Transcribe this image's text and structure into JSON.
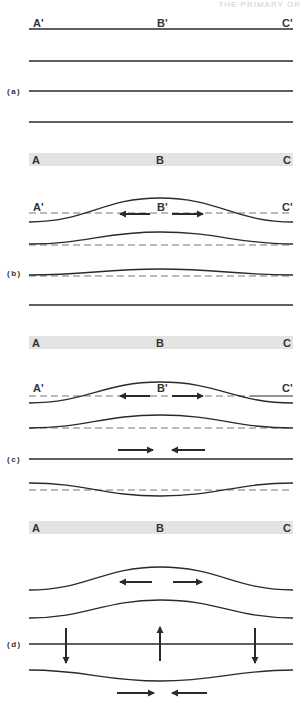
{
  "header": {
    "text": "THE PRIMARY OR"
  },
  "colors": {
    "stroke": "#2a2a2a",
    "dashed": "#777777",
    "band": "#e3e3e3",
    "label": "#333333"
  },
  "x_left": 29,
  "x_mid": 160,
  "x_right": 293,
  "panels": [
    {
      "id": "a",
      "label": "(a)",
      "label_y": 94,
      "top_labels": {
        "y": 27,
        "left": "A'",
        "mid": "B'",
        "right": "C'"
      },
      "curves": [
        {
          "kind": "flat",
          "y": 29
        },
        {
          "kind": "flat",
          "y": 61
        },
        {
          "kind": "flat",
          "y": 91
        },
        {
          "kind": "flat",
          "y": 122
        }
      ],
      "dashed": [],
      "h_arrows": [],
      "v_arrows": [],
      "band": {
        "y": 153,
        "h": 13,
        "left": "A",
        "mid": "B",
        "right": "C"
      }
    },
    {
      "id": "b",
      "label": "(b)",
      "label_y": 276,
      "top_labels": {
        "y": 211,
        "left": "A'",
        "mid": "B'",
        "right": "C'"
      },
      "curves": [
        {
          "kind": "bump",
          "end_y": 222,
          "peak_y": 198
        },
        {
          "kind": "bump",
          "end_y": 244,
          "peak_y": 232
        },
        {
          "kind": "bump",
          "end_y": 275,
          "peak_y": 269
        },
        {
          "kind": "flat",
          "y": 305
        }
      ],
      "dashed": [
        {
          "y": 213
        },
        {
          "y": 245
        },
        {
          "y": 276
        }
      ],
      "h_arrows": [
        {
          "y": 214,
          "from": 150,
          "to": 120
        },
        {
          "y": 214,
          "from": 172,
          "to": 203
        }
      ],
      "v_arrows": [],
      "band": {
        "y": 336,
        "h": 13,
        "left": "A",
        "mid": "B",
        "right": "C"
      }
    },
    {
      "id": "c",
      "label": "(c)",
      "label_y": 462,
      "top_labels": {
        "y": 392,
        "left": "A'",
        "mid": "B'",
        "right": "C'"
      },
      "curves": [
        {
          "kind": "bump",
          "end_y": 403,
          "peak_y": 382
        },
        {
          "kind": "bump",
          "end_y": 428,
          "peak_y": 415
        },
        {
          "kind": "flat",
          "y": 459
        },
        {
          "kind": "bump",
          "end_y": 483,
          "peak_y": 496
        }
      ],
      "dashed": [
        {
          "y": 396,
          "solid_from": 250
        },
        {
          "y": 428
        },
        {
          "y": 490
        }
      ],
      "h_arrows": [
        {
          "y": 214,
          "from": 0,
          "to": 0,
          "skip": true
        },
        {
          "y": 396,
          "from": 150,
          "to": 120
        },
        {
          "y": 396,
          "from": 172,
          "to": 203
        },
        {
          "y": 450,
          "from": 118,
          "to": 153
        },
        {
          "y": 450,
          "from": 205,
          "to": 172
        }
      ],
      "v_arrows": [],
      "band": {
        "y": 521,
        "h": 13,
        "left": "A",
        "mid": "B",
        "right": "C"
      }
    },
    {
      "id": "d",
      "label": "(d)",
      "label_y": 647,
      "top_labels": null,
      "curves": [
        {
          "kind": "bump",
          "end_y": 590,
          "peak_y": 567
        },
        {
          "kind": "bump",
          "end_y": 618,
          "peak_y": 600
        },
        {
          "kind": "flat",
          "y": 644
        },
        {
          "kind": "bump",
          "end_y": 670,
          "peak_y": 681
        }
      ],
      "dashed": [],
      "h_arrows": [
        {
          "y": 582,
          "from": 152,
          "to": 120
        },
        {
          "y": 582,
          "from": 173,
          "to": 202
        },
        {
          "y": 693,
          "from": 117,
          "to": 154
        },
        {
          "y": 693,
          "from": 207,
          "to": 172
        }
      ],
      "v_arrows": [
        {
          "x": 66,
          "from": 628,
          "to": 663
        },
        {
          "x": 160,
          "from": 661,
          "to": 627
        },
        {
          "x": 255,
          "from": 628,
          "to": 663
        }
      ],
      "band": null
    }
  ]
}
